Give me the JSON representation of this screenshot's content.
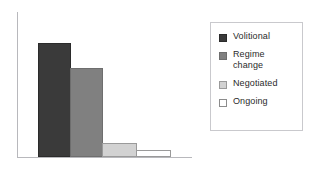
{
  "chart_data": {
    "type": "bar",
    "title": "",
    "subtitle": "",
    "xlabel": "",
    "ylabel": "",
    "categories": [
      "Volitional",
      "Regime change",
      "Negotiated",
      "Ongoing"
    ],
    "values": [
      114,
      89,
      14,
      7
    ],
    "ylim": [
      0,
      145
    ],
    "xtick_labels": [],
    "ytick_labels": [],
    "grid": false,
    "legend_position": "right",
    "annotations": [],
    "series": [
      {
        "name": "",
        "values": [
          114,
          89,
          14,
          7
        ]
      }
    ],
    "bars": [
      {
        "category": "Volitional",
        "value": 114,
        "color": "#3a3a3a",
        "border": "#2b2b2b"
      },
      {
        "category": "Regime change",
        "value": 89,
        "color": "#808080",
        "border": "#6e6e6e"
      },
      {
        "category": "Negotiated",
        "value": 14,
        "color": "#d2d2d2",
        "border": "#9a9a9a"
      },
      {
        "category": "Ongoing",
        "value": 7,
        "color": "#ffffff",
        "border": "#9a9a9a"
      }
    ]
  },
  "axes": {
    "y_axis_color": "#b8b8bc",
    "x_axis_color": "#b8b8bc"
  },
  "legend": {
    "border_color": "#c9c9cd",
    "background": "#ffffff",
    "items": [
      {
        "label": "Volitional",
        "color": "#3a3a3a",
        "border": "#2b2b2b"
      },
      {
        "label": "Regime\nchange",
        "color": "#808080",
        "border": "#6e6e6e"
      },
      {
        "label": "Negotiated",
        "color": "#d2d2d2",
        "border": "#9a9a9a"
      },
      {
        "label": "Ongoing",
        "color": "#ffffff",
        "border": "#8c8c8c"
      }
    ]
  },
  "layout": {
    "bar_geometry": [
      {
        "left": 38,
        "width": 33,
        "height": 114
      },
      {
        "left": 70,
        "width": 33,
        "height": 89
      },
      {
        "left": 102,
        "width": 35,
        "height": 14
      },
      {
        "left": 136,
        "width": 35,
        "height": 7
      }
    ]
  }
}
